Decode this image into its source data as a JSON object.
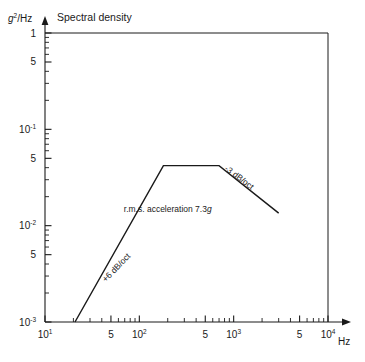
{
  "chart_data": {
    "type": "line",
    "title": "Spectral density",
    "ylabel": "g2/Hz",
    "ylabel_base": "g",
    "ylabel_exp": "2",
    "ylabel_rest": "/Hz",
    "xlabel": "Hz",
    "xscale": "log",
    "yscale": "log",
    "xlim": [
      10,
      10000
    ],
    "ylim": [
      0.001,
      1
    ],
    "grid": false,
    "legend": null,
    "xticks": [
      {
        "value": 10,
        "label_mantissa": "10",
        "label_exp": "1"
      },
      {
        "value": 50,
        "label_mantissa": "5",
        "label_exp": ""
      },
      {
        "value": 100,
        "label_mantissa": "10",
        "label_exp": "2"
      },
      {
        "value": 500,
        "label_mantissa": "5",
        "label_exp": ""
      },
      {
        "value": 1000,
        "label_mantissa": "10",
        "label_exp": "3"
      },
      {
        "value": 5000,
        "label_mantissa": "5",
        "label_exp": ""
      },
      {
        "value": 10000,
        "label_mantissa": "10",
        "label_exp": "4"
      }
    ],
    "yticks": [
      {
        "value": 1,
        "label_mantissa": "1",
        "label_exp": ""
      },
      {
        "value": 0.5,
        "label_mantissa": "5",
        "label_exp": ""
      },
      {
        "value": 0.1,
        "label_mantissa": "10",
        "label_exp": "-1"
      },
      {
        "value": 0.05,
        "label_mantissa": "5",
        "label_exp": ""
      },
      {
        "value": 0.01,
        "label_mantissa": "10",
        "label_exp": "-2"
      },
      {
        "value": 0.005,
        "label_mantissa": "5",
        "label_exp": ""
      },
      {
        "value": 0.001,
        "label_mantissa": "10",
        "label_exp": "-3"
      }
    ],
    "series": [
      {
        "name": "vibration spectrum envelope",
        "points": [
          {
            "x": 20.8,
            "y": 0.001
          },
          {
            "x": 180,
            "y": 0.042
          },
          {
            "x": 700,
            "y": 0.042
          },
          {
            "x": 3000,
            "y": 0.0135
          }
        ]
      }
    ],
    "annotations": [
      {
        "id": "slope-up",
        "text": "+6 dB/oct",
        "x": 60,
        "y": 0.0035,
        "rotation": -46
      },
      {
        "id": "rms",
        "text_plain": "r.m.s. acceleration 7.3",
        "text_italic": "g",
        "x": 200,
        "y": 0.014,
        "rotation": 0
      },
      {
        "id": "slope-down",
        "text": "-3 dB/oct",
        "x": 1100,
        "y": 0.03,
        "rotation": 37
      }
    ]
  }
}
